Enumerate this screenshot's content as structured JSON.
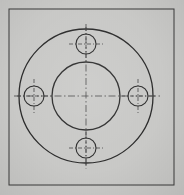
{
  "image": {
    "kind": "engineering-drawing",
    "subject": "circular flange plate with four bolt holes",
    "width": 184,
    "height": 195,
    "view": "front view / plan view",
    "projection": "orthographic",
    "alt_text": "Mechanical drawing of a round flange: large outer circle, concentric central bore, and four equally spaced bolt holes on a bolt circle, with dash-dot centerlines."
  },
  "colors": {
    "paper": "#c9c9c7",
    "object_line": "#2b2b2b",
    "center_line": "#4a4a4a",
    "sheet_border": "#3a3a3a"
  },
  "sheet": {
    "border": {
      "x": 9,
      "y": 9,
      "width": 165,
      "height": 176
    }
  },
  "geometry": {
    "center": {
      "x": 86,
      "y": 96
    },
    "outer_circle": {
      "name": "flange-outer-diameter",
      "cx": 86,
      "cy": 96,
      "r": 67,
      "line_type": "continuous-thick"
    },
    "bore_circle": {
      "name": "central-bore",
      "cx": 86,
      "cy": 96,
      "r": 34,
      "line_type": "continuous-thick"
    },
    "bolt_circle": {
      "name": "bolt-circle",
      "cx": 86,
      "cy": 96,
      "r": 52,
      "visible": false
    },
    "bolt_holes": [
      {
        "id": "hole-top",
        "position": "top",
        "cx": 86,
        "cy": 44,
        "r": 10,
        "angle_deg": 90
      },
      {
        "id": "hole-right",
        "position": "right",
        "cx": 138,
        "cy": 96,
        "r": 10,
        "angle_deg": 0
      },
      {
        "id": "hole-bottom",
        "position": "bottom",
        "cx": 86,
        "cy": 148,
        "r": 10,
        "angle_deg": 270
      },
      {
        "id": "hole-left",
        "position": "left",
        "cx": 34,
        "cy": 96,
        "r": 10,
        "angle_deg": 180
      }
    ],
    "center_lines": {
      "line_type": "dash-dot",
      "main_horizontal": {
        "x1": 14,
        "y1": 96,
        "x2": 160,
        "y2": 96
      },
      "main_vertical": {
        "x1": 86,
        "y1": 24,
        "x2": 86,
        "y2": 169
      },
      "hole_crosshair_extension": 7
    }
  },
  "counts": {
    "circles_total": 6,
    "bolt_holes": 4,
    "centerlines": 10
  },
  "labels": {
    "title": "",
    "dimensions": [],
    "notes": []
  }
}
